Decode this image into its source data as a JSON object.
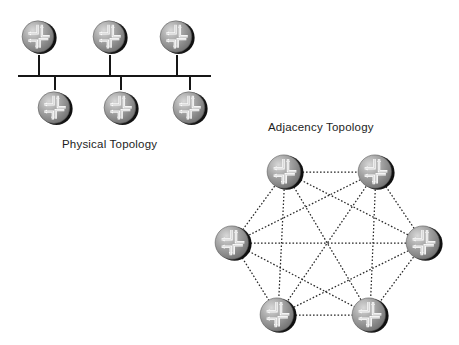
{
  "figure": {
    "background_color": "#ffffff",
    "width": 459,
    "height": 345,
    "node_icon_name": "router-icon",
    "line_color": "#161616",
    "dotted_line_color": "#262626"
  },
  "physical_topology": {
    "caption": "Physical Topology",
    "caption_position": {
      "x": 62,
      "y": 138
    },
    "bus": {
      "name": "shared-bus-segment",
      "x1": 18,
      "x2": 211,
      "y": 76,
      "stroke_width": 1.6
    },
    "routers": [
      {
        "id": "p1",
        "label": "",
        "cx": 39,
        "cy": 37,
        "r": 18,
        "row": "top",
        "stub_x": 39,
        "stub_from_y": 55,
        "stub_to_y": 76
      },
      {
        "id": "p2",
        "label": "",
        "cx": 110,
        "cy": 37,
        "r": 18,
        "row": "top",
        "stub_x": 110,
        "stub_from_y": 55,
        "stub_to_y": 76
      },
      {
        "id": "p3",
        "label": "",
        "cx": 177,
        "cy": 37,
        "r": 18,
        "row": "top",
        "stub_x": 177,
        "stub_from_y": 55,
        "stub_to_y": 76
      },
      {
        "id": "p4",
        "label": "",
        "cx": 55,
        "cy": 108,
        "r": 18,
        "row": "bottom",
        "stub_x": 55,
        "stub_from_y": 76,
        "stub_to_y": 90
      },
      {
        "id": "p5",
        "label": "",
        "cx": 121,
        "cy": 108,
        "r": 18,
        "row": "bottom",
        "stub_x": 121,
        "stub_from_y": 76,
        "stub_to_y": 90
      },
      {
        "id": "p6",
        "label": "",
        "cx": 190,
        "cy": 108,
        "r": 18,
        "row": "bottom",
        "stub_x": 190,
        "stub_from_y": 76,
        "stub_to_y": 90
      }
    ]
  },
  "adjacency_topology": {
    "caption": "Adjacency Topology",
    "caption_position": {
      "x": 268,
      "y": 121
    },
    "link_style": "dotted",
    "routers": [
      {
        "id": "a1",
        "label": "",
        "cx": 285,
        "cy": 172,
        "r": 19,
        "position": "top-left"
      },
      {
        "id": "a2",
        "label": "",
        "cx": 376,
        "cy": 172,
        "r": 19,
        "position": "top-right"
      },
      {
        "id": "a3",
        "label": "",
        "cx": 233,
        "cy": 243,
        "r": 19,
        "position": "left"
      },
      {
        "id": "a4",
        "label": "",
        "cx": 424,
        "cy": 243,
        "r": 19,
        "position": "right"
      },
      {
        "id": "a5",
        "label": "",
        "cx": 278,
        "cy": 315,
        "r": 19,
        "position": "bottom-left"
      },
      {
        "id": "a6",
        "label": "",
        "cx": 370,
        "cy": 315,
        "r": 19,
        "position": "bottom-right"
      }
    ],
    "links": [
      {
        "from": "a1",
        "to": "a2"
      },
      {
        "from": "a1",
        "to": "a3"
      },
      {
        "from": "a1",
        "to": "a4"
      },
      {
        "from": "a1",
        "to": "a5"
      },
      {
        "from": "a1",
        "to": "a6"
      },
      {
        "from": "a2",
        "to": "a3"
      },
      {
        "from": "a2",
        "to": "a4"
      },
      {
        "from": "a2",
        "to": "a5"
      },
      {
        "from": "a2",
        "to": "a6"
      },
      {
        "from": "a3",
        "to": "a4"
      },
      {
        "from": "a3",
        "to": "a5"
      },
      {
        "from": "a3",
        "to": "a6"
      },
      {
        "from": "a4",
        "to": "a5"
      },
      {
        "from": "a4",
        "to": "a6"
      },
      {
        "from": "a5",
        "to": "a6"
      }
    ],
    "link_count": 15,
    "node_count": 6,
    "mesh_type": "full-mesh"
  }
}
